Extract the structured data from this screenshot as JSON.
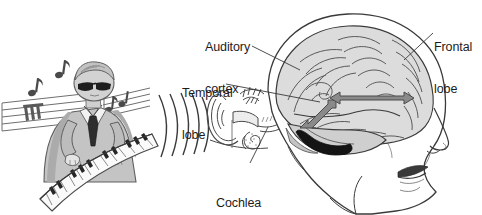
{
  "figure": {
    "background_color": "#ffffff",
    "width": 482,
    "height": 215
  },
  "labels": [
    {
      "id": "auditory-cortex",
      "text": "Auditory\ncortex",
      "line1": "Auditory",
      "line2": "cortex",
      "x": 205,
      "y": 12
    },
    {
      "id": "temporal-lobe",
      "text": "Temporal\nlobe",
      "line1": "Temporal",
      "line2": "lobe",
      "x": 182,
      "y": 58
    },
    {
      "id": "frontal-lobe",
      "text": "Frontal\nlobe",
      "line1": "Frontal",
      "line2": "lobe",
      "x": 434,
      "y": 12
    },
    {
      "id": "cochlea",
      "text": "Cochlea",
      "line1": "Cochlea",
      "line2": "",
      "x": 216,
      "y": 168
    }
  ],
  "label_text": {
    "auditory_cortex_l1": "Auditory",
    "auditory_cortex_l2": "cortex",
    "temporal_lobe_l1": "Temporal",
    "temporal_lobe_l2": "lobe",
    "frontal_lobe_l1": "Frontal",
    "frontal_lobe_l2": "lobe",
    "cochlea": "Cochlea"
  },
  "scene_elements": {
    "pianist": "pianist-playing-keyboard",
    "pianist_details": "man in suit and tie wearing dark sunglasses, short hair, leaning over a curved electronic keyboard",
    "music_staff": "music-staff-lines",
    "music_notes": "eighth-notes",
    "note_count": 3,
    "sound_waves": "concentric-sound-wave-arcs",
    "wave_count": 5,
    "ear": "outer-ear-and-inner-ear-cross-section",
    "head": "human-head-profile-facing-right",
    "brain": "brain-lateral-view-with-gyri",
    "arrows": "gray-double-headed-arrows",
    "arrow_count": 2,
    "shaded_region": "auditory-cortex-black-shaded-area"
  },
  "colors": {
    "ink": "#1c1c1c",
    "outline": "#3a3a3a",
    "brain_fill": "#d9d9d9",
    "brain_fill_light": "#e8e8e8",
    "skin_fill": "#ffffff",
    "arrow_fill": "#8a8a8a",
    "arrow_stroke": "#4a4a4a",
    "auditory_shade": "#141414",
    "suit_fill": "#bfbfbf",
    "suit_shadow": "#9a9a9a",
    "key_black": "#2a2a2a",
    "key_white": "#fbfbfb",
    "leader_line": "#4a4a4a"
  }
}
